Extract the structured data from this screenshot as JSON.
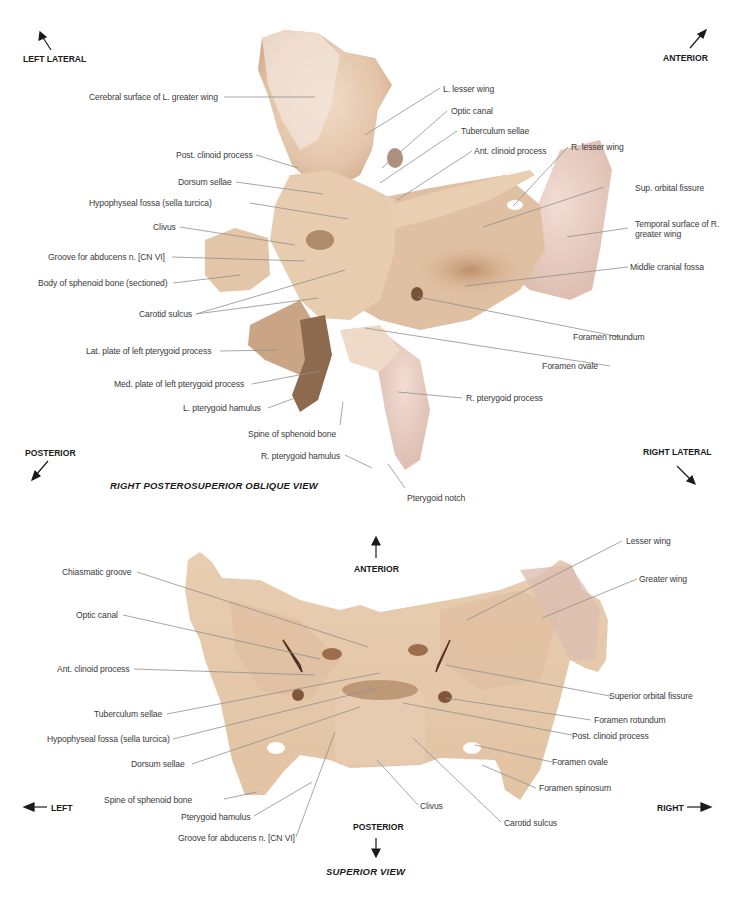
{
  "figure": {
    "top_view": {
      "title": "RIGHT POSTEROSUPERIOR OBLIQUE VIEW",
      "orientation": {
        "left_lateral": "LEFT LATERAL",
        "anterior": "ANTERIOR",
        "posterior": "POSTERIOR",
        "right_lateral": "RIGHT LATERAL"
      },
      "labels": {
        "cerebral_surface_l_greater_wing": "Cerebral surface of L. greater wing",
        "l_lesser_wing": "L. lesser wing",
        "optic_canal": "Optic canal",
        "tuberculum_sellae": "Tuberculum sellae",
        "ant_clinoid_process": "Ant. clinoid process",
        "r_lesser_wing": "R. lesser wing",
        "post_clinoid_process": "Post. clinoid process",
        "dorsum_sellae": "Dorsum sellae",
        "sup_orbital_fissure": "Sup. orbital fissure",
        "hypophyseal_fossa": "Hypophyseal fossa (sella turcica)",
        "temporal_surface_r_greater_wing": "Temporal surface of R. greater wing",
        "clivus": "Clivus",
        "groove_abducens": "Groove for abducens n. [CN VI]",
        "middle_cranial_fossa": "Middle cranial fossa",
        "body_sphenoid_sectioned": "Body of sphenoid bone (sectioned)",
        "carotid_sulcus": "Carotid sulcus",
        "foramen_rotundum": "Foramen rotundum",
        "lat_plate_left_pterygoid": "Lat. plate of left pterygoid process",
        "foramen_ovale": "Foramen ovale",
        "med_plate_left_pterygoid": "Med. plate of left pterygoid process",
        "r_pterygoid_process": "R. pterygoid process",
        "l_pterygoid_hamulus": "L. pterygoid hamulus",
        "spine_sphenoid": "Spine of sphenoid bone",
        "r_pterygoid_hamulus": "R. pterygoid hamulus",
        "pterygoid_notch": "Pterygoid notch"
      }
    },
    "bottom_view": {
      "title": "SUPERIOR VIEW",
      "orientation": {
        "anterior": "ANTERIOR",
        "posterior": "POSTERIOR",
        "left": "LEFT",
        "right": "RIGHT"
      },
      "labels": {
        "lesser_wing": "Lesser wing",
        "chiasmatic_groove": "Chiasmatic groove",
        "greater_wing": "Greater wing",
        "optic_canal": "Optic canal",
        "ant_clinoid_process": "Ant. clinoid process",
        "superior_orbital_fissure": "Superior orbital fissure",
        "tuberculum_sellae": "Tuberculum sellae",
        "foramen_rotundum": "Foramen rotundum",
        "hypophyseal_fossa": "Hypophyseal fossa (sella turcica)",
        "post_clinoid_process": "Post. clinoid process",
        "dorsum_sellae": "Dorsum sellae",
        "foramen_ovale": "Foramen ovale",
        "foramen_spinosum": "Foramen spinosum",
        "spine_sphenoid": "Spine of sphenoid bone",
        "clivus": "Clivus",
        "carotid_sulcus": "Carotid sulcus",
        "pterygoid_hamulus": "Pterygoid hamulus",
        "groove_abducens": "Groove for abducens n. [CN VI]"
      }
    },
    "colors": {
      "bone_light": "#ead3bd",
      "bone_mid": "#dcb99a",
      "bone_dark": "#a9805f",
      "bone_pink": "#e6c8bf",
      "leader_line": "#8f8f8f",
      "label_text": "#3a3a3a",
      "heading_text": "#1a1a1a"
    }
  }
}
